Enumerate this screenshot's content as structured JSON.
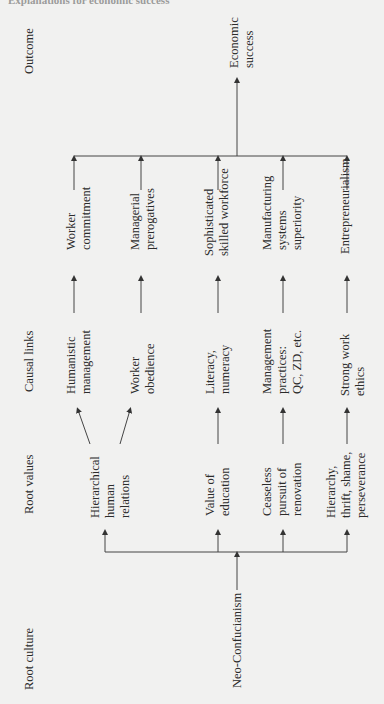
{
  "header": {
    "text": "Explanations for economic success"
  },
  "column_headings": {
    "outcome": "Outcome",
    "causal_links": "Causal links",
    "root_values": "Root values",
    "root_culture": "Root culture"
  },
  "outcome": {
    "label": "Economic\nsuccess"
  },
  "root_culture": {
    "label": "Neo-Confucianism"
  },
  "rows": [
    {
      "root_value": "Hierarchical\nhuman\nrelations",
      "causal_link": "Humanistic\nmanagement",
      "effect": "Worker\ncommitment"
    },
    {
      "root_value": "",
      "causal_link": "Worker\nobedience",
      "effect": "Managerial\nprerogatives"
    },
    {
      "root_value": "Value of\neducation",
      "causal_link": "Literacy,\nnumeracy",
      "effect": "Sophisticated\nskilled workforce"
    },
    {
      "root_value": "Ceaseless\npursuit of\nrenovation",
      "causal_link": "Management\npractices:\nQC, ZD, etc.",
      "effect": "Manufacturing\nsystems\nsuperiority"
    },
    {
      "root_value": "Hierarchy,\nthrift, shame,\nperseverance",
      "causal_link": "Strong work\nethics",
      "effect": "Entrepreneurialism"
    }
  ]
}
